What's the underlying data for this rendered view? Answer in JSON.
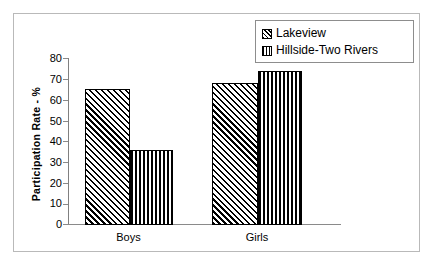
{
  "chart_data": {
    "type": "bar",
    "title": "",
    "xlabel": "",
    "ylabel": "Participation Rate - %",
    "categories": [
      "Boys",
      "Girls"
    ],
    "series": [
      {
        "name": "Lakeview",
        "pattern": "diagonal-hatch",
        "values": [
          65,
          68
        ]
      },
      {
        "name": "Hillside-Two Rivers",
        "pattern": "vertical-hatch",
        "values": [
          36,
          74
        ]
      }
    ],
    "ylim": [
      0,
      80
    ],
    "ytick_step": 10,
    "yticks": [
      0,
      10,
      20,
      30,
      40,
      50,
      60,
      70,
      80
    ],
    "ytick_labels": [
      "0",
      "10",
      "20",
      "30",
      "40",
      "50",
      "60",
      "70",
      "80"
    ],
    "grid": false,
    "legend_position": "top-right",
    "colors": {
      "ink": "#000000",
      "axis": "#8a8a8a",
      "frame": "#b9b9b9",
      "background": "#ffffff"
    }
  },
  "legend": {
    "items": [
      {
        "label": "Lakeview"
      },
      {
        "label": "Hillside-Two Rivers"
      }
    ]
  }
}
